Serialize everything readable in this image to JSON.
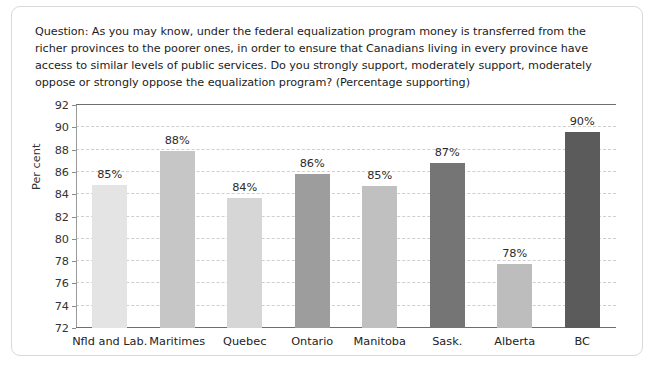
{
  "question": {
    "text": "Question: As you may know, under the federal equalization program money is transferred from the richer provinces to the poorer ones, in order to ensure that Canadians living in every province have access to similar levels of public services. Do you strongly support, moderately support, moderately oppose or strongly oppose the equalization program? (Percentage supporting)"
  },
  "chart_data": {
    "type": "bar",
    "title": "",
    "xlabel": "",
    "ylabel": "Per cent",
    "ylim": [
      72,
      92
    ],
    "yticks": [
      72,
      74,
      76,
      78,
      80,
      82,
      84,
      86,
      88,
      90,
      92
    ],
    "ytick_labels": [
      "72",
      "74",
      "76",
      "78",
      "80",
      "82",
      "84",
      "86",
      "88",
      "90",
      "92"
    ],
    "grid": true,
    "legend": false,
    "categories": [
      "Nfld and Lab.",
      "Maritimes",
      "Quebec",
      "Ontario",
      "Manitoba",
      "Sask.",
      "Alberta",
      "BC"
    ],
    "values": [
      84.8,
      87.9,
      83.7,
      85.8,
      84.7,
      86.8,
      77.7,
      89.6
    ],
    "data_labels": [
      "85%",
      "88%",
      "84%",
      "86%",
      "85%",
      "87%",
      "78%",
      "90%"
    ],
    "bar_colors": [
      "#e4e4e4",
      "#c6c6c6",
      "#d6d6d6",
      "#9d9d9d",
      "#c0c0c0",
      "#757575",
      "#bdbdbd",
      "#5b5b5b"
    ]
  }
}
